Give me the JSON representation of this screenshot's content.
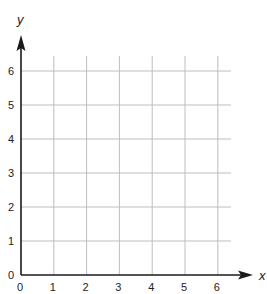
{
  "chart_data": {
    "type": "scatter",
    "title": "",
    "xlabel": "x",
    "ylabel": "y",
    "xlim": [
      0,
      6
    ],
    "ylim": [
      0,
      6
    ],
    "x_ticks": [
      "0",
      "1",
      "2",
      "3",
      "4",
      "5",
      "6"
    ],
    "y_ticks": [
      "0",
      "1",
      "2",
      "3",
      "4",
      "5",
      "6"
    ],
    "grid": true,
    "series": [],
    "legend": null
  },
  "colors": {
    "grid": "#bdbdbd",
    "axis": "#1a1a1a",
    "text": "#222222"
  }
}
